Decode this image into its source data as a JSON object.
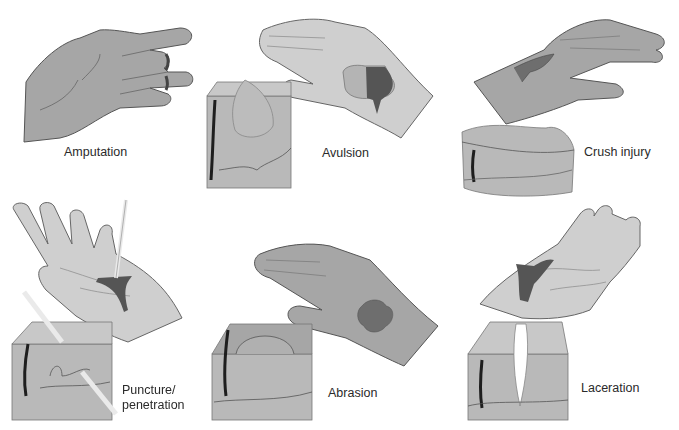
{
  "figure": {
    "colors": {
      "skin_dark": "#a6a6a6",
      "skin_light": "#cfcfcf",
      "skin_outline": "#555555",
      "tissue_block": "#b9b9b9",
      "tissue_top": "#c8c8c8",
      "blood": "#555555",
      "hair": "#1e1e1e",
      "background": "#ffffff"
    },
    "panels": [
      {
        "id": "amputation",
        "label": "Amputation",
        "icon": "hand-amputated-finger-icon"
      },
      {
        "id": "avulsion",
        "label": "Avulsion",
        "icon": "hand-skin-flap-icon"
      },
      {
        "id": "crush",
        "label": "Crush injury",
        "icon": "hand-crushed-tissue-icon"
      },
      {
        "id": "puncture",
        "label_line1": "Puncture/",
        "label_line2": "penetration",
        "icon": "hand-puncture-icon"
      },
      {
        "id": "abrasion",
        "label": "Abrasion",
        "icon": "hand-abrasion-icon"
      },
      {
        "id": "laceration",
        "label": "Laceration",
        "icon": "hand-laceration-icon"
      }
    ]
  }
}
